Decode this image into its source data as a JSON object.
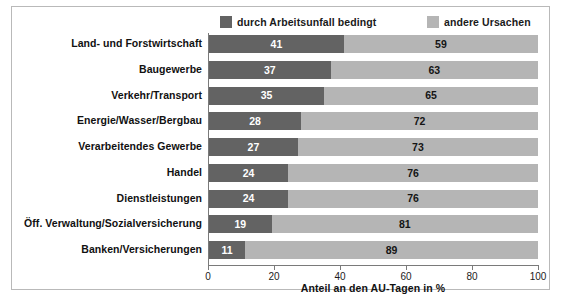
{
  "legend": {
    "entries": [
      {
        "label": "durch Arbeitsunfall bedingt",
        "color": "#636363",
        "key": "accident"
      },
      {
        "label": "andere Ursachen",
        "color": "#b5b5b5",
        "key": "other"
      }
    ]
  },
  "axis": {
    "x_title": "Anteil an den AU-Tagen in %",
    "ticks": [
      "0",
      "20",
      "40",
      "60",
      "80",
      "100"
    ]
  },
  "chart_data": {
    "type": "bar",
    "orientation": "horizontal",
    "stacked": true,
    "title": "",
    "subtitle": "",
    "xlabel": "Anteil an den AU-Tagen in %",
    "ylabel": "",
    "xlim": [
      0,
      100
    ],
    "xticks": [
      0,
      20,
      40,
      60,
      80,
      100
    ],
    "grid": false,
    "legend_position": "top",
    "categories": [
      "Land- und Forstwirtschaft",
      "Baugewerbe",
      "Verkehr/Transport",
      "Energie/Wasser/Bergbau",
      "Verarbeitendes Gewerbe",
      "Handel",
      "Dienstleistungen",
      "Öff. Verwaltung/Sozialversicherung",
      "Banken/Versicherungen"
    ],
    "series": [
      {
        "name": "durch Arbeitsunfall bedingt",
        "color": "#636363",
        "values": [
          41,
          37,
          35,
          28,
          27,
          24,
          24,
          19,
          11
        ]
      },
      {
        "name": "andere Ursachen",
        "color": "#b5b5b5",
        "values": [
          59,
          63,
          65,
          72,
          73,
          76,
          76,
          81,
          89
        ]
      }
    ]
  }
}
